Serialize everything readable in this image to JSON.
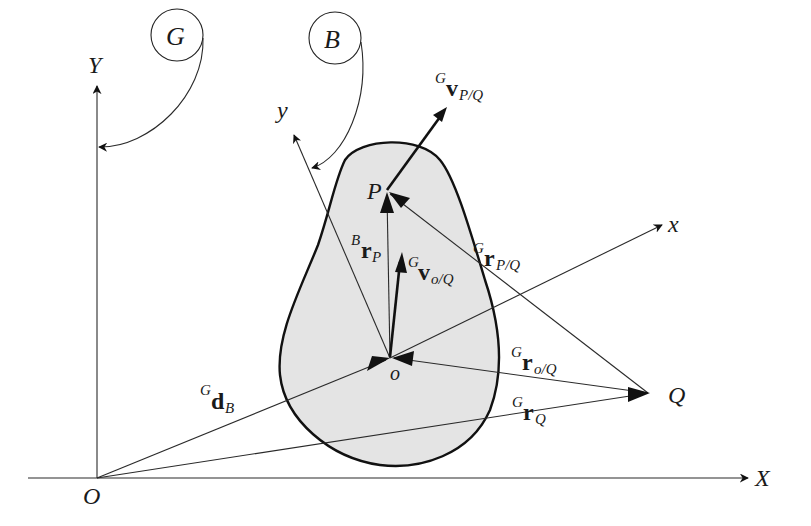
{
  "diagram": {
    "frames": {
      "global": {
        "circle_label": "G",
        "axis_x": "X",
        "axis_y": "Y",
        "origin": "O"
      },
      "body": {
        "circle_label": "B",
        "axis_x": "x",
        "axis_y": "y",
        "origin": "o"
      }
    },
    "points": {
      "P": "P",
      "Q": "Q"
    },
    "vectors": {
      "d_B": {
        "sup": "G",
        "main": "d",
        "sub": "B"
      },
      "r_P": {
        "sup": "B",
        "main": "r",
        "sub": "P"
      },
      "v_oQ": {
        "sup": "G",
        "main": "v",
        "sub": "o/Q"
      },
      "r_PQ": {
        "sup": "G",
        "main": "r",
        "sub": "P/Q"
      },
      "v_PQ": {
        "sup": "G",
        "main": "v",
        "sub": "P/Q"
      },
      "r_oQ": {
        "sup": "G",
        "main": "r",
        "sub": "o/Q"
      },
      "r_Q": {
        "sup": "G",
        "main": "r",
        "sub": "Q"
      }
    },
    "colors": {
      "body_fill": "#e4e4e4",
      "stroke": "#111111",
      "background": "#ffffff"
    }
  }
}
